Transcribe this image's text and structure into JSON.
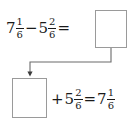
{
  "canvas": {
    "width": 139,
    "height": 128,
    "background_color": "#ffffff",
    "text_color": "#1a1a1a",
    "box_border_color": "#9a9a9a",
    "arrow_color": "#4a4a4a"
  },
  "problem": {
    "type": "mixed-number-subtraction-check",
    "equations": [
      {
        "id": "subtraction",
        "spoken": "7 and 1 sixth minus 5 and 2 sixths equals blank",
        "terms": [
          {
            "whole": "7",
            "numerator": "1",
            "denominator": "6"
          },
          {
            "operator": "−"
          },
          {
            "whole": "5",
            "numerator": "2",
            "denominator": "6"
          },
          {
            "operator": "="
          },
          {
            "answer_box": ""
          }
        ]
      },
      {
        "id": "addition-check",
        "spoken": "blank plus 5 and 2 sixths equals 7 and 1 sixth",
        "terms": [
          {
            "answer_box": ""
          },
          {
            "operator": "+"
          },
          {
            "whole": "5",
            "numerator": "2",
            "denominator": "6"
          },
          {
            "operator": "="
          },
          {
            "whole": "7",
            "numerator": "1",
            "denominator": "6"
          }
        ]
      }
    ]
  },
  "top_equation": {
    "term1_whole": "7",
    "term1_numerator": "1",
    "term1_denominator": "6",
    "operator_minus": "−",
    "term2_whole": "5",
    "term2_numerator": "2",
    "term2_denominator": "6",
    "operator_equals": "=",
    "answer_value": ""
  },
  "bottom_equation": {
    "answer_value": "",
    "operator_plus": "+",
    "term_whole": "5",
    "term_numerator": "2",
    "term_denominator": "6",
    "operator_equals": "=",
    "result_whole": "7",
    "result_numerator": "1",
    "result_denominator": "6"
  },
  "arrow": {
    "label": "",
    "description": "elbow arrow from bottom of top answer box down, left, then down into top of bottom answer box"
  }
}
